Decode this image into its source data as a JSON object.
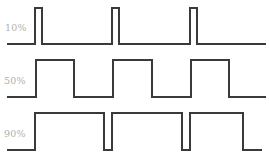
{
  "figure": {
    "background_color": "#ffffff",
    "stroke_color": "#3a3a3a",
    "label_color": "#b0b0b0",
    "width": 269,
    "height": 163
  },
  "rows": [
    {
      "label": "10%",
      "label_x": 5,
      "label_y": 31,
      "duty_cycle_percent": 10,
      "high_y": 8,
      "low_y": 44,
      "path": "M 7 44 L 35 44 L 35 8 L 42 8 L 42 44 L 112 44 L 112 8 L 119 8 L 119 44 L 190 44 L 190 8 L 197 8 L 197 44 L 266 44"
    },
    {
      "label": "50%",
      "label_x": 4,
      "label_y": 84,
      "duty_cycle_percent": 50,
      "high_y": 60,
      "low_y": 97,
      "path": "M 7 97 L 36 97 L 36 60 L 74 60 L 74 97 L 113 97 L 113 60 L 152 60 L 152 97 L 191 97 L 191 60 L 229 60 L 229 97 L 266 97"
    },
    {
      "label": "90%",
      "label_x": 4,
      "label_y": 137,
      "duty_cycle_percent": 90,
      "high_y": 113,
      "low_y": 150,
      "path": "M 7 150 L 35 150 L 35 113 L 104 113 L 104 150 L 112 150 L 112 113 L 182 113 L 182 150 L 190 150 L 190 113 L 243 113 L 243 150 L 262 150"
    }
  ],
  "chart_data": {
    "type": "line",
    "subtitle": "",
    "xlabel": "",
    "ylabel": "",
    "grid": false,
    "legend_position": "left",
    "xlim": [
      0,
      269
    ],
    "ylim": [
      0,
      163
    ],
    "series": [
      {
        "name": "10%",
        "duty_cycle_percent": 10,
        "period_px": 78,
        "pulse_width_px": 7,
        "high_y": 8,
        "low_y": 44,
        "rising_edges_x": [
          35,
          112,
          190
        ],
        "falling_edges_x": [
          42,
          119,
          197
        ],
        "start_x": 7,
        "end_x": 266,
        "levels": [
          0,
          1,
          0,
          1,
          0,
          1,
          0
        ]
      },
      {
        "name": "50%",
        "duty_cycle_percent": 50,
        "period_px": 78,
        "pulse_width_px": 38,
        "high_y": 60,
        "low_y": 97,
        "rising_edges_x": [
          36,
          113,
          191
        ],
        "falling_edges_x": [
          74,
          152,
          229
        ],
        "start_x": 7,
        "end_x": 266,
        "levels": [
          0,
          1,
          0,
          1,
          0,
          1,
          0
        ]
      },
      {
        "name": "90%",
        "duty_cycle_percent": 90,
        "period_px": 78,
        "pulse_width_px": 70,
        "high_y": 113,
        "low_y": 150,
        "rising_edges_x": [
          35,
          112,
          190
        ],
        "falling_edges_x": [
          104,
          182,
          243
        ],
        "start_x": 7,
        "end_x": 262,
        "levels": [
          0,
          1,
          0,
          1,
          0,
          1,
          0
        ]
      }
    ]
  }
}
